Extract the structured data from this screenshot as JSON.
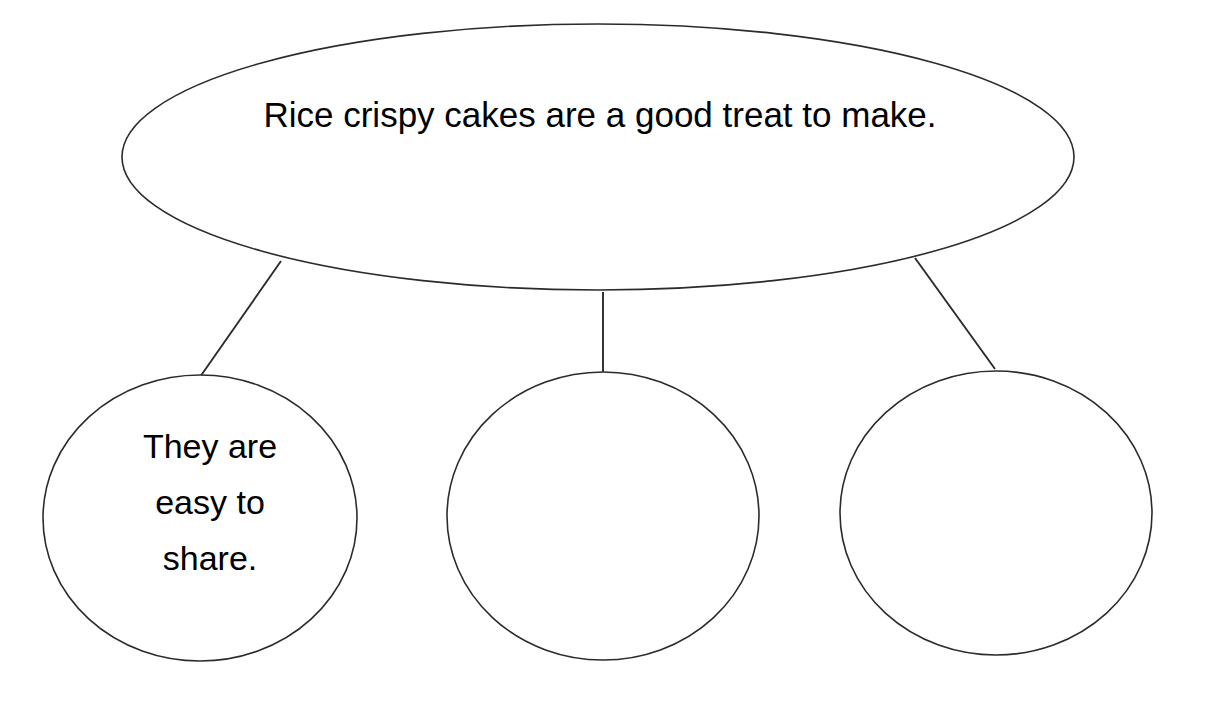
{
  "page": {
    "background_color": "#ffffff",
    "ink_color": "#2b2b2b",
    "text_color": "#000000",
    "type": "bubble-map-graphic-organizer"
  },
  "main_idea": {
    "shape": "ellipse",
    "text": "Rice crispy cakes are a good treat to make.",
    "center_x": 598,
    "center_y": 157,
    "radius_x": 476,
    "radius_y": 133
  },
  "details": [
    {
      "id": "detail-1",
      "shape": "circle",
      "text": "They are\neasy to\nshare.",
      "filled": true,
      "center_x": 200,
      "center_y": 518,
      "radius_x": 157,
      "radius_y": 143
    },
    {
      "id": "detail-2",
      "shape": "circle",
      "text": "",
      "filled": false,
      "center_x": 603,
      "center_y": 516,
      "radius_x": 156,
      "radius_y": 144
    },
    {
      "id": "detail-3",
      "shape": "circle",
      "text": "",
      "filled": false,
      "center_x": 996,
      "center_y": 513,
      "radius_x": 156,
      "radius_y": 142
    }
  ],
  "connectors": [
    {
      "id": "connector-left",
      "x1": 281,
      "y1": 261,
      "x2": 200,
      "y2": 377
    },
    {
      "id": "connector-middle",
      "x1": 603,
      "y1": 292,
      "x2": 603,
      "y2": 381
    },
    {
      "id": "connector-right",
      "x1": 915,
      "y1": 258,
      "x2": 995,
      "y2": 369
    }
  ]
}
